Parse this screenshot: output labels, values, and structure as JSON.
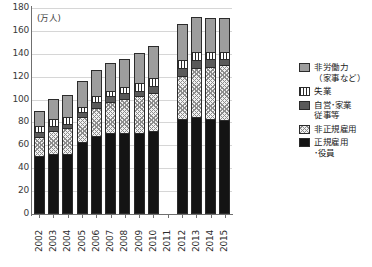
{
  "chart_data": {
    "type": "bar",
    "stacked": true,
    "title": "",
    "unit_label": "(万人)",
    "xlabel": "",
    "ylabel": "",
    "ylim": [
      0,
      180
    ],
    "ytick_step": 20,
    "yticks": [
      "180",
      "160",
      "140",
      "120",
      "100",
      "80",
      "60",
      "40",
      "20",
      "0"
    ],
    "grid": true,
    "legend_position": "right",
    "categories": [
      "2002",
      "2003",
      "2004",
      "2005",
      "2006",
      "2007",
      "2008",
      "2009",
      "2010",
      "2011",
      "2012",
      "2013",
      "2014",
      "2015"
    ],
    "missing_categories": [
      "2011"
    ],
    "series": [
      {
        "name": "正規雇用・役員",
        "pattern": "solid-black",
        "values": [
          50,
          52,
          52,
          62,
          67,
          70,
          70,
          70,
          72,
          null,
          82,
          84,
          82,
          81
        ]
      },
      {
        "name": "非正規雇用",
        "pattern": "cross-hatch",
        "values": [
          16,
          20,
          22,
          22,
          25,
          27,
          30,
          32,
          33,
          null,
          38,
          43,
          46,
          48
        ]
      },
      {
        "name": "自営・家業従事等",
        "pattern": "solid-dark-gray",
        "values": [
          5,
          4,
          4,
          4,
          5,
          5,
          5,
          5,
          6,
          null,
          7,
          7,
          7,
          6
        ]
      },
      {
        "name": "失業",
        "pattern": "vertical-stripe",
        "values": [
          5,
          6,
          6,
          5,
          5,
          5,
          5,
          7,
          7,
          null,
          7,
          7,
          6,
          6
        ]
      },
      {
        "name": "非労働力（家事など）",
        "pattern": "solid-light-gray",
        "values": [
          13,
          18,
          19,
          22,
          23,
          24,
          25,
          26,
          28,
          null,
          31,
          30,
          29,
          29
        ]
      }
    ],
    "totals": [
      89,
      100,
      103,
      115,
      125,
      131,
      135,
      140,
      146,
      null,
      165,
      171,
      170,
      170
    ]
  },
  "legend": {
    "items": [
      {
        "label": "非労働力\n（家事など）",
        "line1": "非労働力",
        "line2": "（家事など）",
        "swatch": "solid-light-gray"
      },
      {
        "label": "失業",
        "line1": "失業",
        "line2": "",
        "swatch": "vertical-stripe"
      },
      {
        "label": "自営・家業従事等",
        "line1": "自営･家業",
        "line2": "従事等",
        "swatch": "solid-dark-gray"
      },
      {
        "label": "非正規雇用",
        "line1": "非正規雇用",
        "line2": "",
        "swatch": "cross-hatch"
      },
      {
        "label": "正規雇用・役員",
        "line1": "正規雇用",
        "line2": "･役員",
        "swatch": "solid-black"
      }
    ]
  },
  "colors": {
    "regular": "#141414",
    "nonregular": "#f2f2f2",
    "self_employed": "#5a5a5a",
    "unemployed": "#ffffff",
    "nonlabor": "#9d9d9d",
    "axis": "#6f6f6f",
    "grid": "#d6d6d6"
  }
}
